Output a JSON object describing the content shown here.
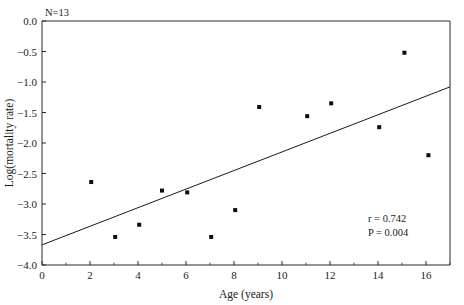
{
  "chart_data": {
    "type": "scatter",
    "title": "",
    "xlabel": "Age (years)",
    "ylabel": "Log(mortality rate)",
    "xlim": [
      0,
      17
    ],
    "ylim": [
      -4.0,
      0.0
    ],
    "grid": false,
    "legend": null,
    "x_ticks": [
      0,
      2,
      4,
      6,
      8,
      10,
      12,
      14,
      16
    ],
    "x_tick_labels": [
      "0",
      "2",
      "4",
      "6",
      "8",
      "10",
      "12",
      "14",
      "16"
    ],
    "x_minor_ticks": [
      1,
      3,
      5,
      7,
      9,
      11,
      13,
      15,
      17
    ],
    "y_ticks": [
      0.0,
      -0.5,
      -1.0,
      -1.5,
      -2.0,
      -2.5,
      -3.0,
      -3.5,
      -4.0
    ],
    "y_tick_labels": [
      "0.0",
      "−0.5",
      "−1.0",
      "−1.5",
      "−2.0",
      "−2.5",
      "−3.0",
      "−3.5",
      "−4.0"
    ],
    "points": [
      {
        "x": 2.05,
        "y": -2.64
      },
      {
        "x": 3.05,
        "y": -3.54
      },
      {
        "x": 4.05,
        "y": -3.34
      },
      {
        "x": 5.0,
        "y": -2.78
      },
      {
        "x": 6.05,
        "y": -2.81
      },
      {
        "x": 7.05,
        "y": -3.54
      },
      {
        "x": 8.05,
        "y": -3.1
      },
      {
        "x": 9.05,
        "y": -1.41
      },
      {
        "x": 11.05,
        "y": -1.56
      },
      {
        "x": 12.05,
        "y": -1.35
      },
      {
        "x": 14.05,
        "y": -1.74
      },
      {
        "x": 15.1,
        "y": -0.52
      },
      {
        "x": 16.1,
        "y": -2.2
      }
    ],
    "fit_line": {
      "x_start": 0.0,
      "y_start": -3.67,
      "x_end": 17.0,
      "y_end": -1.08
    },
    "annotations": {
      "n_label": "N=13",
      "r_label": "r = 0.742",
      "p_label": "P = 0.004"
    },
    "colors": {
      "point": "#0d0d0d",
      "line": "#1a1a1a",
      "axis": "#2a2a2a",
      "background": "#ffffff"
    }
  }
}
